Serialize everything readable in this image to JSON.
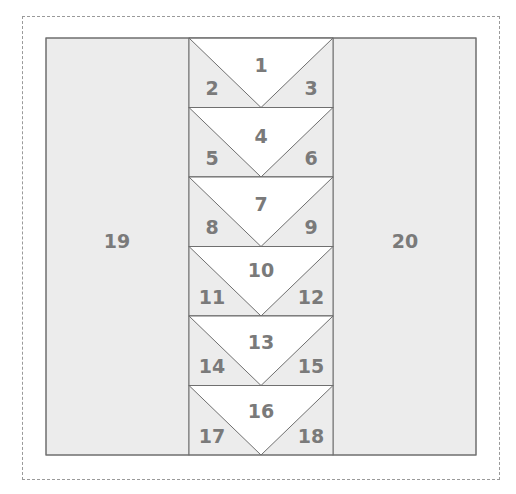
{
  "diagram": {
    "title": "",
    "colors": {
      "fill": "#ececec",
      "white": "#ffffff",
      "line": "#6f6f6f",
      "label": "#7a7a7a",
      "dash": "#9a9a9a"
    },
    "side_panels": [
      {
        "id": "19",
        "label": "19"
      },
      {
        "id": "20",
        "label": "20"
      }
    ],
    "rows": [
      {
        "center": "1",
        "left": "2",
        "right": "3"
      },
      {
        "center": "4",
        "left": "5",
        "right": "6"
      },
      {
        "center": "7",
        "left": "8",
        "right": "9"
      },
      {
        "center": "10",
        "left": "11",
        "right": "12"
      },
      {
        "center": "13",
        "left": "14",
        "right": "15"
      },
      {
        "center": "16",
        "left": "17",
        "right": "18"
      }
    ]
  }
}
